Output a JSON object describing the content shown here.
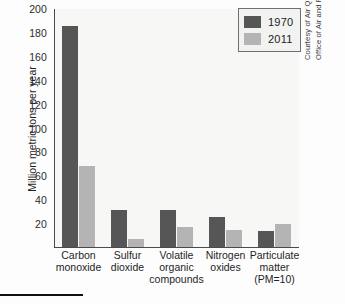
{
  "chart_data": {
    "type": "bar",
    "title": "",
    "xlabel": "",
    "ylabel": "Million metric tons per year",
    "ylim": [
      0,
      200
    ],
    "yticks": [
      200,
      180,
      160,
      140,
      120,
      100,
      80,
      60,
      40,
      20
    ],
    "grid": false,
    "legend_position": "top-right",
    "categories": [
      "Carbon monoxide",
      "Sulfur dioxide",
      "Volatile organic compounds",
      "Nitrogen oxides",
      "Particulate matter (PM=10)"
    ],
    "category_lines": [
      [
        "Carbon",
        "monoxide"
      ],
      [
        "Sulfur",
        "dioxide"
      ],
      [
        "Volatile",
        "organic",
        "compounds"
      ],
      [
        "Nitrogen",
        "oxides"
      ],
      [
        "Particulate",
        "matter",
        "(PM=10)"
      ]
    ],
    "series": [
      {
        "name": "1970",
        "color": "#565656",
        "values": [
          185,
          31,
          31,
          25,
          13
        ]
      },
      {
        "name": "2011",
        "color": "#b4b4b4",
        "values": [
          68,
          7,
          17,
          14,
          19
        ]
      }
    ]
  },
  "legend": {
    "items": [
      {
        "label": "1970",
        "color": "#565656"
      },
      {
        "label": "2011",
        "color": "#b4b4b4"
      }
    ]
  },
  "credit": {
    "line1": "Courtesy of Air Quality Planning and Standards,",
    "line2": "Office of Air and Radiation, EPA"
  }
}
